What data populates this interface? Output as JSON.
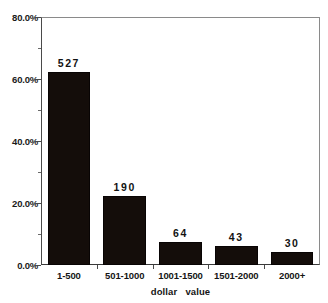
{
  "chart_data": {
    "type": "bar",
    "title": "",
    "subtitle": "",
    "xlabel": "dollar   value",
    "ylabel": "",
    "categories": [
      "1-500",
      "501-1000",
      "1001-1500",
      "1501-2000",
      "2000+"
    ],
    "values": [
      62.3,
      22.3,
      7.4,
      6.1,
      4.2
    ],
    "bar_labels": [
      "527",
      "190",
      "64",
      "43",
      "30"
    ],
    "counts": [
      527,
      190,
      64,
      43,
      30
    ],
    "ylim": [
      0,
      80
    ],
    "y_tick_labels": [
      "0.0%",
      "20.0%",
      "40.0%",
      "60.0%",
      "80.0%"
    ],
    "y_tick_values": [
      0,
      20,
      40,
      60,
      80
    ],
    "y_minor_tick_values": [
      10,
      30,
      50,
      70
    ],
    "grid": false,
    "legend": "none",
    "bar_color": "#140d0a",
    "axis_color": "#4a4a4a",
    "background_color": "#ffffff"
  },
  "axes": {
    "x_title": "dollar   value",
    "y_labels": [
      {
        "text": "80.0%",
        "value": 80
      },
      {
        "text": "60.0%",
        "value": 60
      },
      {
        "text": "40.0%",
        "value": 40
      },
      {
        "text": "20.0%",
        "value": 20
      },
      {
        "text": "0.0%",
        "value": 0
      }
    ]
  }
}
